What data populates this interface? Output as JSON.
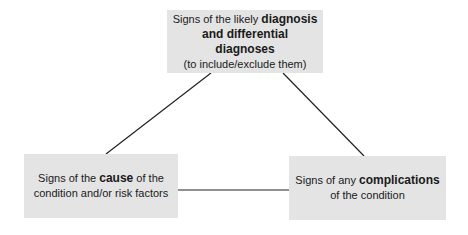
{
  "diagram": {
    "type": "triangle",
    "line_color": "#222222",
    "box_color": "#e4e4e4",
    "nodes": {
      "top": {
        "line1_pre": "Signs of the likely ",
        "line1_bold": "diagnosis",
        "line2_bold": "and differential diagnoses",
        "line3": "(to include/exclude them)"
      },
      "left": {
        "line1_pre": "Signs of the ",
        "line1_bold": "cause",
        "line1_post": " of the",
        "line2": "condition and/or risk factors"
      },
      "right": {
        "line1_pre": "Signs of any ",
        "line1_bold": "complications",
        "line2": "of the condition"
      }
    },
    "edges": [
      {
        "from": "top",
        "to": "left"
      },
      {
        "from": "top",
        "to": "right"
      },
      {
        "from": "left",
        "to": "right"
      }
    ]
  }
}
